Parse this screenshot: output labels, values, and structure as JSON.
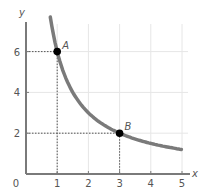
{
  "chart_data": {
    "type": "line",
    "title": "",
    "xlabel": "x",
    "ylabel": "y",
    "origin_label": "0",
    "xlim": [
      0,
      5
    ],
    "ylim": [
      0,
      7.5
    ],
    "x_ticks": [
      1,
      2,
      3,
      4,
      5
    ],
    "y_ticks": [
      2,
      4,
      6
    ],
    "grid": true,
    "series": [
      {
        "name": "curve y = 6/x",
        "x": [
          0.8,
          1,
          1.5,
          2,
          2.5,
          3,
          3.5,
          4,
          4.5,
          5
        ],
        "values": [
          7.5,
          6,
          4,
          3,
          2.4,
          2,
          1.71,
          1.5,
          1.33,
          1.2
        ],
        "color": "#7a7a7a"
      }
    ],
    "points": [
      {
        "label": "A",
        "x": 1,
        "y": 6
      },
      {
        "label": "B",
        "x": 3,
        "y": 2
      }
    ],
    "annotations": [
      "Dotted guide lines from A to x=1 and y=6",
      "Dotted guide lines from B to x=3 and y=2"
    ]
  },
  "colors": {
    "axis": "#7a7a7a",
    "curve": "#7a7a7a",
    "grid": "#e6e6e6",
    "point": "#000000",
    "guide": "#555555"
  }
}
